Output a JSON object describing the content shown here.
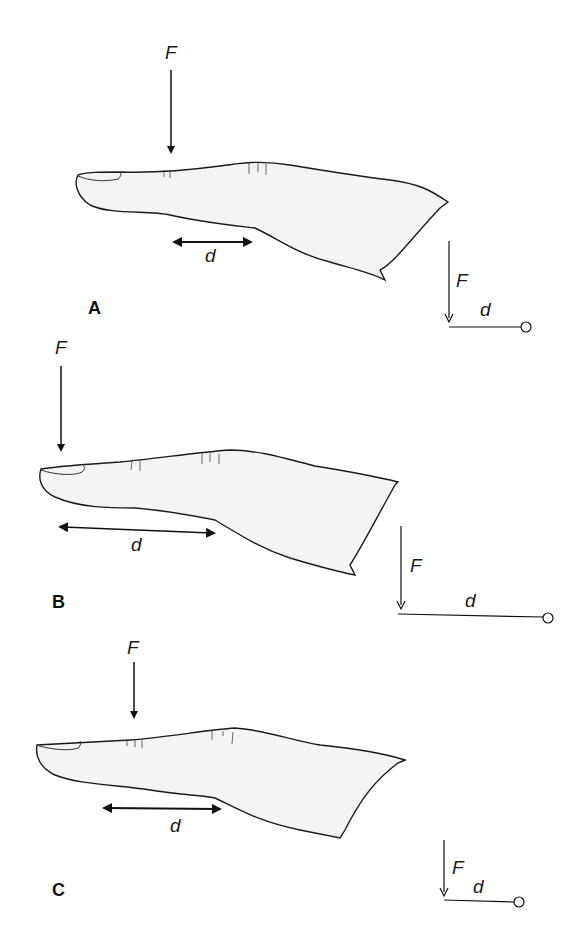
{
  "figure": {
    "panels": [
      {
        "id": "A",
        "label": "A",
        "force_label": "F",
        "distance_label": "d",
        "inset": {
          "force_label": "F",
          "distance_label": "d"
        }
      },
      {
        "id": "B",
        "label": "B",
        "force_label": "F",
        "distance_label": "d",
        "inset": {
          "force_label": "F",
          "distance_label": "d"
        }
      },
      {
        "id": "C",
        "label": "C",
        "force_label": "F",
        "distance_label": "d",
        "inset": {
          "force_label": "F",
          "distance_label": "d"
        }
      }
    ]
  }
}
